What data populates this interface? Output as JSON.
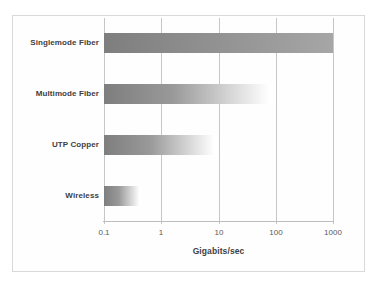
{
  "chart_data": {
    "type": "bar",
    "orientation": "horizontal",
    "categories": [
      "Singlemode Fiber",
      "Multimode Fiber",
      "UTP Copper",
      "Wireless"
    ],
    "values": [
      1000,
      100,
      10,
      0.45
    ],
    "bars": [
      {
        "label": "Singlemode Fiber",
        "value": 1000,
        "fade_to_white": false
      },
      {
        "label": "Multimode Fiber",
        "value": 100,
        "fade_to_white": true
      },
      {
        "label": "UTP Copper",
        "value": 10,
        "fade_to_white": true
      },
      {
        "label": "Wireless",
        "value": 0.45,
        "fade_to_white": true
      }
    ],
    "title": "",
    "xlabel": "Gigabits/sec",
    "ylabel": "",
    "x_scale": "log",
    "xlim": [
      0.1,
      1000
    ],
    "x_ticks": [
      0.1,
      1,
      10,
      100,
      1000
    ],
    "x_tick_labels": [
      "0.1",
      "1",
      "10",
      "100",
      "1000"
    ],
    "grid": "vertical-gridlines-on",
    "legend": "none",
    "colors": {
      "bar_start": "#7e7e7e",
      "bar_mid": "#999999",
      "bar_fade_end": "#ffffff",
      "bar_solid_end": "#a6a6a6",
      "gridline": "#c6c6c6",
      "frame_border": "#d9d9d9",
      "label_text": "#3f3f3f",
      "tick_text": "#595959"
    }
  }
}
